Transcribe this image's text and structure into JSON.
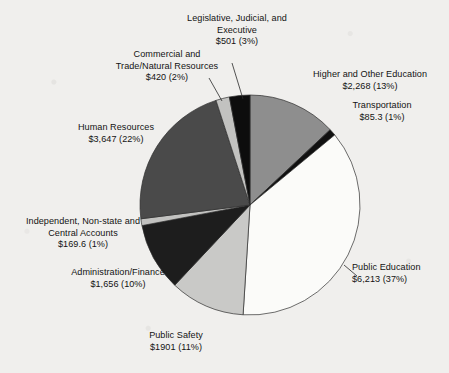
{
  "chart_data": {
    "type": "pie",
    "title": "",
    "subtitle": "",
    "xlabel": "",
    "ylabel": "",
    "legend_position": "none",
    "grid": false,
    "labels_outside": true,
    "value_prefix": "$",
    "categories": [
      "Higher and Other Education",
      "Transportation",
      "Public Education",
      "Public Safety",
      "Administration/Finance",
      "Independent, Non-state and Central Accounts",
      "Human Resources",
      "Commercial and Trade/Natural Resources",
      "Legislative, Judicial, and Executive"
    ],
    "values": [
      2268,
      85.3,
      6213,
      1901,
      1656,
      169.6,
      3647,
      420,
      501
    ],
    "percents": [
      13,
      1,
      37,
      11,
      10,
      1,
      22,
      2,
      3
    ],
    "colors": [
      "#8e8e8e",
      "#111111",
      "#fbfbf9",
      "#c9c9c7",
      "#1d1d1d",
      "#c2c2c0",
      "#4a4a4a",
      "#c2c2c0",
      "#0d0d0d"
    ],
    "slices": [
      {
        "name": "Higher and Other Education",
        "value_text": "$2,268",
        "percent_text": "(13%)",
        "value": 2268,
        "percent": 13,
        "color": "#8e8e8e"
      },
      {
        "name": "Transportation",
        "value_text": "$85.3",
        "percent_text": "(1%)",
        "value": 85.3,
        "percent": 1,
        "color": "#111111"
      },
      {
        "name": "Public Education",
        "value_text": "$6,213",
        "percent_text": "(37%)",
        "value": 6213,
        "percent": 37,
        "color": "#fbfbf9"
      },
      {
        "name": "Public Safety",
        "value_text": "$1901",
        "percent_text": "(11%)",
        "value": 1901,
        "percent": 11,
        "color": "#c9c9c7"
      },
      {
        "name": "Administration/Finance",
        "value_text": "$1,656",
        "percent_text": "(10%)",
        "value": 1656,
        "percent": 10,
        "color": "#1d1d1d"
      },
      {
        "name": "Independent, Non-state and Central Accounts",
        "value_text": "$169.6",
        "percent_text": "(1%)",
        "value": 169.6,
        "percent": 1,
        "color": "#c2c2c0"
      },
      {
        "name": "Human Resources",
        "value_text": "$3,647",
        "percent_text": "(22%)",
        "value": 3647,
        "percent": 22,
        "color": "#4a4a4a"
      },
      {
        "name": "Commercial and Trade/Natural Resources",
        "value_text": "$420",
        "percent_text": "(2%)",
        "value": 420,
        "percent": 2,
        "color": "#c2c2c0"
      },
      {
        "name": "Legislative, Judicial, and Executive",
        "value_text": "$501",
        "percent_text": "(3%)",
        "value": 501,
        "percent": 3,
        "color": "#0d0d0d"
      }
    ]
  },
  "labels": {
    "legislative": {
      "line1": "Legislative, Judicial, and",
      "line2": "Executive",
      "value": "$501 (3%)"
    },
    "commercial": {
      "line1": "Commercial and",
      "line2": "Trade/Natural Resources",
      "value": "$420 (2%)"
    },
    "higher_education": {
      "line1": "Higher and Other Education",
      "value": "$2,268 (13%)"
    },
    "transportation": {
      "line1": "Transportation",
      "value": "$85.3 (1%)"
    },
    "human_resources": {
      "line1": "Human Resources",
      "value": "$3,647 (22%)"
    },
    "independent": {
      "line1": "Independent, Non-state and",
      "line2": "Central Accounts",
      "value": "$169.6 (1%)"
    },
    "administration": {
      "line1": "Administration/Finance",
      "value": "$1,656 (10%)"
    },
    "public_safety": {
      "line1": "Public Safety",
      "value": "$1901 (11%)"
    },
    "public_education": {
      "line1": "Public Education",
      "value": "$6,213 (37%)"
    }
  }
}
